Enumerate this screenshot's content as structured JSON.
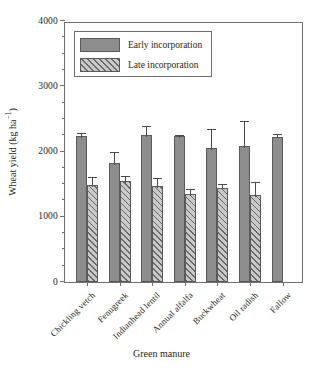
{
  "chart_data": {
    "type": "bar",
    "title": "",
    "xlabel": "Green manure",
    "ylabel_text": "Wheat yield (kg ha",
    "ylabel_sup": "−1",
    "ylabel_tail": ")",
    "ylabel_full": "Wheat yield (kg ha⁻¹)",
    "categories": [
      "Chickling vetch",
      "Fenugreek",
      "Indianhead lentil",
      "Annual alfalfa",
      "Buckwheat",
      "Oil radish",
      "Fallow"
    ],
    "ylim": [
      0,
      4000
    ],
    "yticks": [
      0,
      1000,
      2000,
      3000,
      4000
    ],
    "ytick_labels": [
      "0",
      "1000",
      "2000",
      "3000",
      "4000"
    ],
    "yminor_step": 250,
    "grid": false,
    "legend_position": "upper-left-inside",
    "series": [
      {
        "name": "Early incorporation",
        "fill": "#8d8d8d",
        "hatch": "none",
        "values": [
          2240,
          1830,
          2260,
          2240,
          2050,
          2080,
          2230
        ],
        "errors": [
          80,
          200,
          160,
          40,
          330,
          420,
          70
        ]
      },
      {
        "name": "Late incorporation",
        "fill": "#c9c9c9",
        "hatch": "diagonal",
        "values": [
          1490,
          1550,
          1470,
          1350,
          1440,
          1330,
          null
        ],
        "errors": [
          150,
          110,
          160,
          110,
          100,
          240,
          null
        ]
      }
    ]
  },
  "legend": {
    "items": [
      {
        "label": "Early incorporation",
        "style": "early"
      },
      {
        "label": "Late incorporation",
        "style": "late"
      }
    ]
  },
  "caption": {
    "text": ""
  },
  "colors": {
    "bar_early": "#8d8d8d",
    "bar_late": "#c9c9c9",
    "hatch": "#6a6a6a",
    "axis": "#6e6e6e",
    "text": "#231f20"
  }
}
